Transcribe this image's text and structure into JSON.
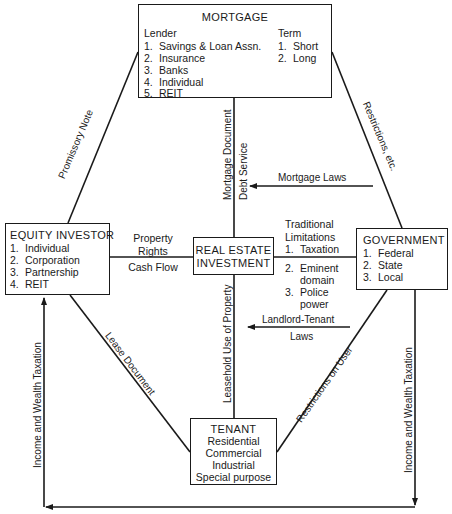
{
  "mortgage": {
    "title": "MORTGAGE",
    "lender_heading": "Lender",
    "lenders": [
      {
        "num": "1.",
        "label": "Savings & Loan Assn."
      },
      {
        "num": "2.",
        "label": "Insurance"
      },
      {
        "num": "3.",
        "label": "Banks"
      },
      {
        "num": "4.",
        "label": "Individual"
      },
      {
        "num": "5.",
        "label": "REIT"
      }
    ],
    "term_heading": "Term",
    "terms": [
      {
        "num": "1.",
        "label": "Short"
      },
      {
        "num": "2.",
        "label": "Long"
      }
    ]
  },
  "equity_investor": {
    "title": "EQUITY INVESTOR",
    "items": [
      {
        "num": "1.",
        "label": "Individual"
      },
      {
        "num": "2.",
        "label": "Corporation"
      },
      {
        "num": "3.",
        "label": "Partnership"
      },
      {
        "num": "4.",
        "label": "REIT"
      }
    ]
  },
  "real_estate": {
    "line1": "REAL ESTATE",
    "line2": "INVESTMENT"
  },
  "government": {
    "title": "GOVERNMENT",
    "items": [
      {
        "num": "1.",
        "label": "Federal"
      },
      {
        "num": "2.",
        "label": "State"
      },
      {
        "num": "3.",
        "label": "Local"
      }
    ]
  },
  "tenant": {
    "title": "TENANT",
    "items": [
      "Residential",
      "Commercial",
      "Industrial",
      "Special purpose"
    ]
  },
  "edges": {
    "promissory_note": "Promissory Note",
    "restrictions_etc": "Restrictions, etc.",
    "mortgage_document": "Mortgage Document",
    "debt_service": "Debt Service",
    "mortgage_laws": "Mortgage Laws",
    "property_rights_1": "Property",
    "property_rights_2": "Rights",
    "cash_flow": "Cash Flow",
    "traditional_limitations": {
      "heading1": "Traditional",
      "heading2": "Limitations",
      "items": [
        {
          "num": "1.",
          "lines": [
            "Taxation"
          ]
        },
        {
          "num": "2.",
          "lines": [
            "Eminent",
            "domain"
          ]
        },
        {
          "num": "3.",
          "lines": [
            "Police",
            "power"
          ]
        }
      ]
    },
    "landlord_tenant_1": "Landlord-Tenant",
    "landlord_tenant_2": "Laws",
    "lease_document": "Lease Document",
    "leasehold_use": "Leasehold Use of Property",
    "restrictions_on_user": "Restrictions on User",
    "income_wealth_left": "Income and Wealth Taxation",
    "income_wealth_right": "Income and Wealth Taxation"
  }
}
